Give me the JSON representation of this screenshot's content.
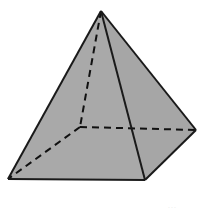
{
  "figure": {
    "name": "square-pyramid",
    "canvas": {
      "width": 204,
      "height": 214,
      "background": "#ffffff"
    },
    "style": {
      "face_left_fill": "#a9a9a9",
      "face_right_fill": "#a6a6a6",
      "edge_color": "#1a1a1a",
      "edge_width": 2,
      "hidden_edge_color": "#111111",
      "hidden_edge_width": 2,
      "hidden_edge_dash": "7 5"
    },
    "vertices": {
      "apex": {
        "label": "apex",
        "x": 101,
        "y": 11,
        "hidden": false
      },
      "base_front_left": {
        "label": "base-front-left",
        "x": 8,
        "y": 179,
        "hidden": false
      },
      "base_front_right": {
        "label": "base-front-right",
        "x": 145,
        "y": 180,
        "hidden": false
      },
      "base_back_right": {
        "label": "base-back-right",
        "x": 196,
        "y": 130,
        "hidden": false
      },
      "base_back_left": {
        "label": "base-back-left",
        "x": 80,
        "y": 127,
        "hidden": true
      }
    },
    "faces": [
      {
        "name": "lateral-face-left",
        "fill": "#a9a9a9",
        "points": "101,11 8,179 145,180"
      },
      {
        "name": "lateral-face-right",
        "fill": "#a6a6a6",
        "points": "101,11 145,180 196,130"
      }
    ],
    "edges_visible": [
      {
        "name": "edge-apex-to-front-left",
        "points": "101,11 8,179"
      },
      {
        "name": "edge-apex-to-back-right",
        "points": "101,11 196,130"
      },
      {
        "name": "edge-apex-to-front-right",
        "points": "101,11 145,180"
      },
      {
        "name": "edge-base-front",
        "points": "8,179 145,180"
      },
      {
        "name": "edge-base-right",
        "points": "145,180 196,130"
      }
    ],
    "edges_hidden": [
      {
        "name": "edge-apex-to-back-left",
        "points": "101,11 80,127"
      },
      {
        "name": "edge-base-back-left-to-right",
        "points": "80,127 196,130"
      },
      {
        "name": "edge-base-back-left-to-front",
        "points": "80,127 8,179"
      }
    ],
    "corner_artifact": {
      "text": "...",
      "x": 168,
      "y": 202
    }
  }
}
